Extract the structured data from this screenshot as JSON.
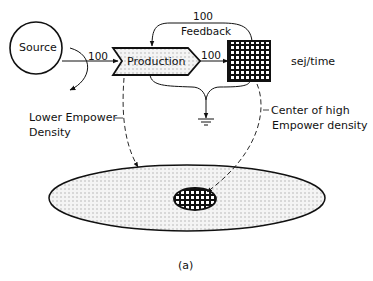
{
  "diagram": {
    "caption": "(a)",
    "nodes": {
      "source": {
        "label": "Source",
        "shape": "circle"
      },
      "production": {
        "label": "Production",
        "shape": "chevron-pentagon"
      },
      "storage": {
        "label": "",
        "shape": "grid-square"
      },
      "heat_sink": {
        "label": "",
        "shape": "ground-symbol"
      }
    },
    "flows": {
      "source_to_production": "100",
      "production_to_storage": "100",
      "feedback_value": "100",
      "feedback_label": "Feedback"
    },
    "units": "sej/time",
    "annotations": {
      "lower_line1": "Lower Empower",
      "lower_line2": "Density",
      "center_line1": "Center of high",
      "center_line2": "Empower density"
    },
    "colors": {
      "stroke": "#111111",
      "fill_dots": "#bbbbbb",
      "background": "#ffffff"
    }
  }
}
